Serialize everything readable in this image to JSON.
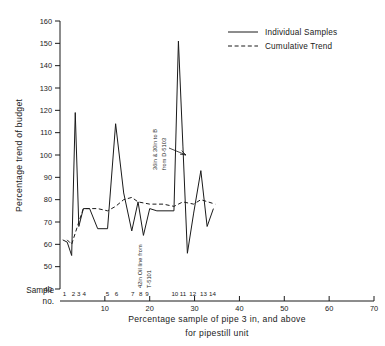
{
  "chart_data": {
    "type": "line",
    "title": "",
    "xlabel": "Percentage sample of pipe 3 in, and above for pipestill unit",
    "xlabel_line1": "Percentage sample of pipe 3 in, and above",
    "xlabel_line2": "for pipestill unit",
    "ylabel": "Percentage trend of budget",
    "xlim": [
      0,
      70
    ],
    "ylim": [
      40,
      160
    ],
    "xticks": [
      10,
      20,
      30,
      40,
      50,
      60,
      70
    ],
    "yticks": [
      40,
      50,
      60,
      70,
      80,
      90,
      100,
      110,
      120,
      130,
      140,
      150,
      160
    ],
    "grid": false,
    "legend_position": "top-right",
    "sample_axis_caption_line1": "Sample",
    "sample_axis_caption_line2": "no.",
    "sample_numbers": [
      "1",
      "2",
      "3",
      "4",
      "5",
      "6",
      "7",
      "8",
      "9",
      "10",
      "11",
      "12",
      "13",
      "14"
    ],
    "sample_x": [
      1.0,
      3.0,
      4.2,
      5.4,
      10.6,
      12.6,
      16.2,
      18.0,
      19.4,
      25.6,
      27.4,
      29.6,
      32.0,
      34.0
    ],
    "series": [
      {
        "name": "Individual Samples",
        "style": "solid",
        "x": [
          0.6,
          1.6,
          2.6,
          3.4,
          4.2,
          5.2,
          6.6,
          8.4,
          10.6,
          12.4,
          14.2,
          16.0,
          17.4,
          18.6,
          20.0,
          21.6,
          25.4,
          26.4,
          27.4,
          28.4,
          29.8,
          31.4,
          32.8,
          34.2
        ],
        "values": [
          62,
          61,
          55,
          119,
          68,
          76,
          76,
          67,
          67,
          114,
          83,
          66,
          79,
          64,
          76,
          75,
          75,
          151,
          104,
          56,
          74,
          93,
          68,
          76
        ]
      },
      {
        "name": "Cumulative Trend",
        "style": "dashed",
        "x": [
          1.6,
          2.6,
          3.4,
          4.2,
          5.2,
          8.4,
          10.6,
          12.4,
          14.2,
          16.0,
          17.4,
          20.0,
          23.0,
          25.4,
          27.4,
          29.8,
          31.4,
          33.0,
          34.6
        ],
        "values": [
          62,
          60,
          65,
          70,
          76,
          76,
          75,
          77,
          80,
          81,
          79,
          78,
          78,
          77,
          79,
          78,
          80,
          79,
          78
        ]
      }
    ],
    "annotations": [
      {
        "id": "annotation-upper",
        "text_line1": "36in & 30in to B",
        "text_line2": "from D-5103",
        "rotation": -90
      },
      {
        "id": "annotation-lower",
        "text_line1": "42in Oil line from",
        "text_line2": "T-5101",
        "rotation": -90
      }
    ]
  },
  "legend": {
    "items": [
      {
        "label": "Individual Samples",
        "style": "solid"
      },
      {
        "label": "Cumulative Trend",
        "style": "dashed"
      }
    ]
  }
}
